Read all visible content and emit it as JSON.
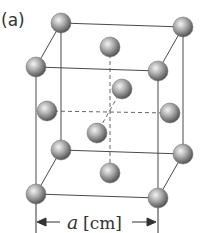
{
  "figure": {
    "panel_label": "(a)",
    "dimension_label": {
      "variable": "a",
      "unit": "[cm]"
    },
    "structure": "face-centered tetragonal unit cell (elongated cube with corner and face-center atoms)",
    "colors": {
      "line": "#4a4a4a",
      "sphere_light": "#f2f2f2",
      "sphere_mid": "#a8a8a8",
      "sphere_dark": "#555555",
      "text": "#333333"
    },
    "atoms": {
      "corners": [
        {
          "name": "back-top-left",
          "x": 61,
          "y": 23
        },
        {
          "name": "back-top-right",
          "x": 183,
          "y": 27
        },
        {
          "name": "front-top-left",
          "x": 36,
          "y": 67
        },
        {
          "name": "front-top-right",
          "x": 158,
          "y": 71
        },
        {
          "name": "back-bottom-left",
          "x": 61,
          "y": 150
        },
        {
          "name": "back-bottom-right",
          "x": 183,
          "y": 154
        },
        {
          "name": "front-bottom-left",
          "x": 36,
          "y": 194
        },
        {
          "name": "front-bottom-right",
          "x": 158,
          "y": 198
        }
      ],
      "face_centers": [
        {
          "name": "top-face",
          "x": 110,
          "y": 47
        },
        {
          "name": "bottom-face",
          "x": 110,
          "y": 173
        },
        {
          "name": "left-face",
          "x": 47,
          "y": 111
        },
        {
          "name": "right-face",
          "x": 170,
          "y": 113
        },
        {
          "name": "back-face",
          "x": 122,
          "y": 89
        },
        {
          "name": "front-face",
          "x": 97,
          "y": 133
        }
      ]
    }
  }
}
